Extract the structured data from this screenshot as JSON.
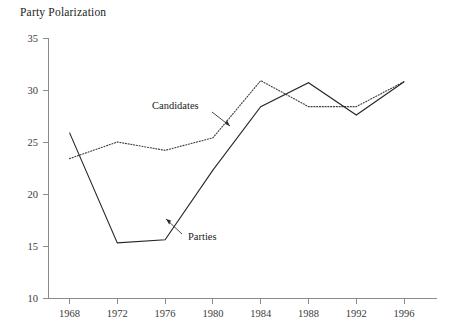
{
  "chart_data": {
    "type": "line",
    "title": "Party Polarization",
    "xlabel": "",
    "ylabel": "",
    "x": [
      1968,
      1972,
      1976,
      1980,
      1984,
      1988,
      1992,
      1996
    ],
    "xtick_labels": [
      "1968",
      "1972",
      "1976",
      "1980",
      "1984",
      "1988",
      "1992",
      "1996"
    ],
    "ytick_labels": [
      "10",
      "15",
      "20",
      "25",
      "30",
      "35"
    ],
    "yticks": [
      10,
      15,
      20,
      25,
      30,
      35
    ],
    "xlim": [
      1966,
      1998
    ],
    "ylim": [
      10,
      35
    ],
    "grid": false,
    "legend_position": "inline-annotations",
    "series": [
      {
        "name": "Candidates",
        "style": "dotted",
        "color": "#3d3d3d",
        "values": [
          23.4,
          25.0,
          24.2,
          25.4,
          30.9,
          28.4,
          28.4,
          30.8
        ]
      },
      {
        "name": "Parties",
        "style": "solid",
        "color": "#262626",
        "values": [
          25.9,
          15.3,
          15.6,
          22.3,
          28.4,
          30.7,
          27.6,
          30.8
        ]
      }
    ],
    "annotations": [
      {
        "text": "Candidates",
        "series": "Candidates",
        "points_to_year": 1980
      },
      {
        "text": "Parties",
        "series": "Parties",
        "points_to_year": 1978
      }
    ]
  },
  "labels": {
    "title": "Party Polarization",
    "y": {
      "t35": "35",
      "t30": "30",
      "t25": "25",
      "t20": "20",
      "t15": "15",
      "t10": "10"
    },
    "x": {
      "t1968": "1968",
      "t1972": "1972",
      "t1976": "1976",
      "t1980": "1980",
      "t1984": "1984",
      "t1988": "1988",
      "t1992": "1992",
      "t1996": "1996"
    },
    "annot": {
      "candidates": "Candidates",
      "parties": "Parties"
    }
  }
}
